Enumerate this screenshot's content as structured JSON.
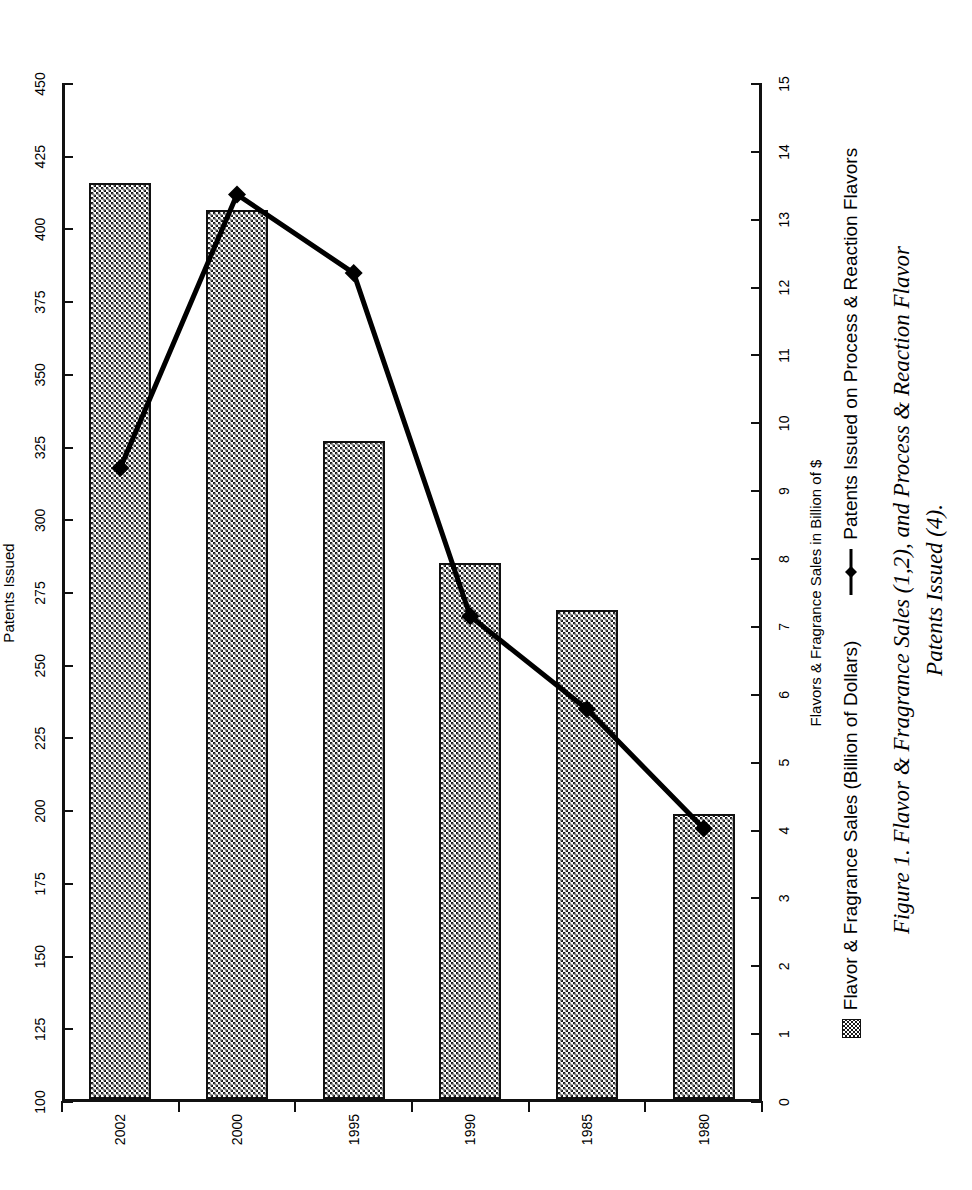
{
  "figure": {
    "caption_line1": "Figure 1. Flavor & Fragrance Sales (1,2), and Process & Reaction Flavor",
    "caption_line2": "Patents Issued (4)."
  },
  "legend": {
    "position": "bottom",
    "items": [
      {
        "label": "Flavor & Fragrance Sales (Billion of Dollars)",
        "marker": "filled-pattern-swatch"
      },
      {
        "label": "Patents Issued on Process & Reaction Flavors",
        "marker": "line-with-diamond-marker"
      }
    ]
  },
  "axes": {
    "category": {
      "title": "Years",
      "ticks": [
        "1980",
        "1985",
        "1990",
        "1995",
        "2000",
        "2002"
      ]
    },
    "sales": {
      "title": "Flavors & Fragrance Sales in Billion of $",
      "ticks": [
        "0",
        "1",
        "2",
        "3",
        "4",
        "5",
        "6",
        "7",
        "8",
        "9",
        "10",
        "11",
        "12",
        "13",
        "14",
        "15"
      ],
      "min": 0,
      "max": 15
    },
    "patents": {
      "title": "Patents Issued",
      "ticks": [
        "100",
        "125",
        "150",
        "175",
        "200",
        "225",
        "250",
        "275",
        "300",
        "325",
        "350",
        "375",
        "400",
        "425",
        "450"
      ],
      "min": 100,
      "max": 450
    }
  },
  "chart_data": {
    "type": "bar",
    "title": "",
    "subtitle": "",
    "categories": [
      "1980",
      "1985",
      "1990",
      "1995",
      "2000",
      "2002"
    ],
    "xlabel": "Years",
    "ylabel": "Flavors & Fragrance Sales in Billion of $",
    "y2label": "Patents Issued",
    "ylim": [
      0,
      15
    ],
    "y2lim": [
      100,
      450
    ],
    "grid": false,
    "legend_position": "bottom",
    "orientation": "horizontal-bars",
    "series": [
      {
        "name": "Flavor & Fragrance Sales (Billion of Dollars)",
        "type": "bar",
        "axis": "sales",
        "values": [
          4.2,
          7.2,
          7.9,
          9.7,
          13.1,
          13.5
        ]
      },
      {
        "name": "Patents Issued on Process & Reaction Flavors",
        "type": "line",
        "axis": "patents",
        "marker": "diamond",
        "values": [
          194,
          235,
          267,
          385,
          412,
          318
        ]
      }
    ]
  },
  "colors": {
    "ink": "#111111",
    "background": "#ffffff",
    "bar_fill": "#1a1a1a",
    "line": "#000000"
  }
}
